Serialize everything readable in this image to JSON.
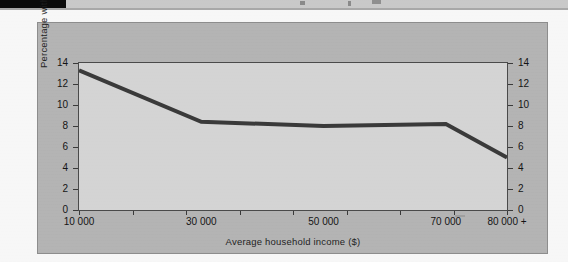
{
  "page": {
    "background_color": "#f7f7f7",
    "card_color": "#b4b4b4",
    "plot_background_color": "#d4d4d4",
    "line_color": "#3a3a3a",
    "axis_color": "#4a4a4a"
  },
  "chart_data": {
    "type": "line",
    "title": "",
    "xlabel": "Average household income ($)",
    "ylabel": "Percentage with lower functional health",
    "x": [
      10000,
      30000,
      50000,
      70000,
      80000
    ],
    "values": [
      13.3,
      8.4,
      8.0,
      8.2,
      5.0
    ],
    "series": [
      {
        "name": "Percentage with lower functional health",
        "values": [
          13.3,
          8.4,
          8.0,
          8.2,
          5.0
        ]
      }
    ],
    "xtick_labels": [
      "10 000",
      "30 000",
      "50 000",
      "70 000",
      "80 000 +"
    ],
    "xtick_values": [
      10000,
      30000,
      50000,
      70000,
      80000
    ],
    "ytick_labels": [
      "0",
      "2",
      "4",
      "6",
      "8",
      "10",
      "12",
      "14"
    ],
    "ytick_values": [
      0,
      2,
      4,
      6,
      8,
      10,
      12,
      14
    ],
    "ylim": [
      0,
      14
    ],
    "xlim": [
      10000,
      80000
    ],
    "right_axis": {
      "ytick_labels": [
        "0",
        "2",
        "4",
        "6",
        "8",
        "10",
        "12",
        "14"
      ],
      "ytick_values": [
        0,
        2,
        4,
        6,
        8,
        10,
        12,
        14
      ]
    },
    "grid": false,
    "legend": null,
    "minor_xticks": 8
  }
}
